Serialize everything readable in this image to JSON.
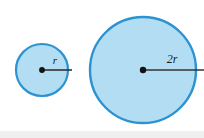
{
  "figure": {
    "background_color": "#ffffff",
    "bottom_band_color": "#efefef",
    "circle_fill": "#b3ddf2",
    "circle_stroke": "#2b93d1",
    "center_dot_color": "#121212",
    "radius_line_color": "#1a1a1a",
    "label_color": "#1a1a1a"
  },
  "shapes": {
    "small_circle": {
      "name": "small-circle",
      "center_x": 42,
      "center_y": 70,
      "radius_px": 26,
      "radius_label": "r",
      "label_x": 55,
      "label_y": 64,
      "line_end_x": 72
    },
    "large_circle": {
      "name": "large-circle",
      "center_x": 143,
      "center_y": 70,
      "radius_px": 53,
      "radius_label": "2r",
      "label_x": 172,
      "label_y": 63,
      "line_end_x": 204
    }
  }
}
